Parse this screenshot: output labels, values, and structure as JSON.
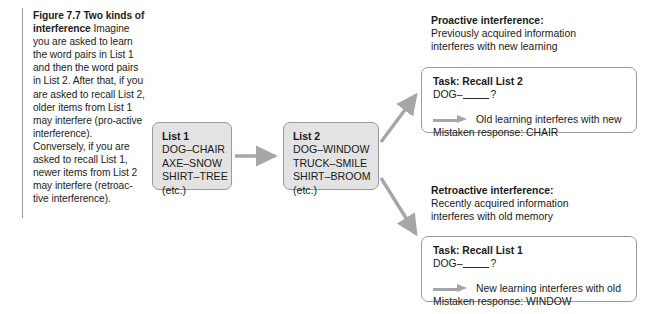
{
  "figure": {
    "title": "Figure 7.7 Two kinds of interference",
    "caption_body": "Imagine you are asked to learn the word pairs in List 1 and then the word pairs in List 2. After that, if you are asked to recall List 2, older items from List 1 may interfere (pro-active interference). Conversely, if you are asked to recall List 1, newer items from List 2 may interfere (retroac-tive interference)."
  },
  "lists": {
    "list1": {
      "title": "List 1",
      "items": [
        "DOG–CHAIR",
        "AXE–SNOW",
        "SHIRT–TREE",
        "(etc.)"
      ]
    },
    "list2": {
      "title": "List 2",
      "items": [
        "DOG–WINDOW",
        "TRUCK–SMILE",
        "SHIRT–BROOM",
        "(etc.)"
      ]
    }
  },
  "proactive": {
    "heading": "Proactive interference:",
    "description_line1": "Previously acquired information",
    "description_line2": "interferes with new learning",
    "task": {
      "title": "Task: Recall List 2",
      "prompt_prefix": "DOG–",
      "prompt_suffix": "?",
      "result": "Old learning interferes with new",
      "mistaken_response": "Mistaken response: CHAIR"
    }
  },
  "retroactive": {
    "heading": "Retroactive interference:",
    "description_line1": "Recently acquired information",
    "description_line2": "interferes with old memory",
    "task": {
      "title": "Task: Recall List 1",
      "prompt_prefix": "DOG–",
      "prompt_suffix": "?",
      "result": "New learning interferes with old",
      "mistaken_response": "Mistaken response: WINDOW"
    }
  },
  "colors": {
    "box_fill": "#e3e3e3",
    "box_border": "#9b9b9b",
    "arrow": "#a6a6a6",
    "rule": "#9a9a9a",
    "text": "#1a1a1a"
  }
}
